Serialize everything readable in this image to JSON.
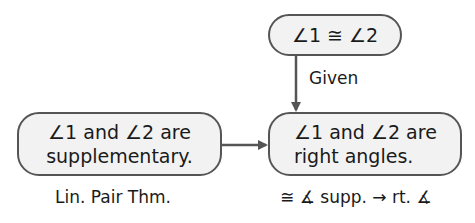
{
  "nodes": {
    "top": {
      "text": "∠1 ≅ ∠2"
    },
    "left": {
      "line1": "∠1 and  ∠2 are",
      "line2": "supplementary."
    },
    "right": {
      "line1": "∠1 and  ∠2 are",
      "line2": "right angles."
    }
  },
  "labels": {
    "given": "Given",
    "left_reason": "Lin. Pair Thm.",
    "right_reason": "≅ ∡ supp. → rt. ∡"
  },
  "colors": {
    "border": "#555555",
    "fill": "#f2f2f2",
    "arrow": "#555555"
  }
}
